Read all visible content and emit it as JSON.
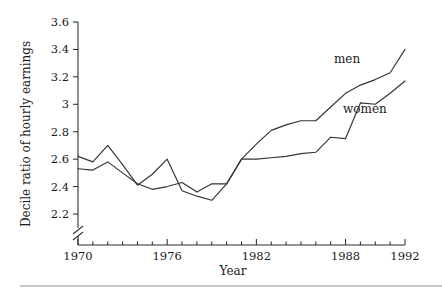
{
  "chart_data": {
    "type": "line",
    "title": "",
    "xlabel": "Year",
    "ylabel": "Decile ratio of hourly earnings",
    "xlim": [
      1970,
      1992
    ],
    "ylim": [
      2.2,
      3.6
    ],
    "grid": false,
    "legend_position": "inline-right",
    "y_axis_break": true,
    "x_ticks": [
      1970,
      1971,
      1972,
      1973,
      1974,
      1975,
      1976,
      1977,
      1978,
      1979,
      1980,
      1981,
      1982,
      1983,
      1984,
      1985,
      1986,
      1987,
      1988,
      1989,
      1990,
      1991,
      1992
    ],
    "x_tick_labels": [
      "1970",
      "",
      "",
      "",
      "",
      "",
      "1976",
      "",
      "",
      "",
      "",
      "",
      "1982",
      "",
      "",
      "",
      "",
      "",
      "1988",
      "",
      "",
      "",
      "1992"
    ],
    "y_ticks": [
      2.2,
      2.4,
      2.6,
      2.8,
      3.0,
      3.2,
      3.4,
      3.6
    ],
    "y_tick_labels": [
      "2.2",
      "2.4",
      "2.6",
      "2.8",
      "3",
      "3.2",
      "3.4",
      "3.6"
    ],
    "x": [
      1970,
      1971,
      1972,
      1973,
      1974,
      1975,
      1976,
      1977,
      1978,
      1979,
      1980,
      1981,
      1982,
      1983,
      1984,
      1985,
      1986,
      1987,
      1988,
      1989,
      1990,
      1991,
      1992
    ],
    "series": [
      {
        "name": "men",
        "color": "#333333",
        "label_x": 1988.1,
        "label_y": 3.3,
        "values": [
          2.62,
          2.58,
          2.7,
          2.56,
          2.41,
          2.49,
          2.6,
          2.37,
          2.33,
          2.3,
          2.42,
          2.6,
          2.71,
          2.81,
          2.85,
          2.88,
          2.88,
          2.98,
          3.08,
          3.14,
          3.18,
          3.23,
          3.4
        ]
      },
      {
        "name": "women",
        "color": "#333333",
        "label_x": 1989.3,
        "label_y": 2.94,
        "values": [
          2.53,
          2.52,
          2.58,
          2.5,
          2.42,
          2.38,
          2.4,
          2.43,
          2.36,
          2.42,
          2.42,
          2.6,
          2.6,
          2.61,
          2.62,
          2.64,
          2.65,
          2.76,
          2.75,
          3.01,
          3.0,
          3.08,
          3.17
        ]
      }
    ]
  },
  "axes": {
    "y_label_text": "Decile ratio of hourly earnings",
    "x_label_text": "Year"
  }
}
